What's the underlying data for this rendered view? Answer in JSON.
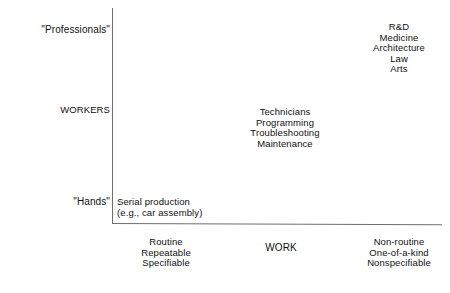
{
  "diagram": {
    "axes": {
      "vertical": {
        "name": "WORKERS",
        "title": "WORKERS",
        "top_label": "\"Professionals\"",
        "bottom_label": "\"Hands\""
      },
      "horizontal": {
        "name": "WORK",
        "title": "WORK",
        "left_label_lines": [
          "Routine",
          "Repeatable",
          "Specifiable"
        ],
        "right_label_lines": [
          "Non-routine",
          "One-of-a-kind",
          "Nonspecifiable"
        ]
      }
    },
    "clusters": [
      {
        "id": "serial-production",
        "quadrant": "low-workers-routine-work",
        "align": "left",
        "lines": [
          "Serial production",
          "(e.g., car assembly)"
        ]
      },
      {
        "id": "technical-occupations",
        "quadrant": "mid-workers-mid-work",
        "align": "center",
        "lines": [
          "Technicians",
          "Programming",
          "Troubleshooting",
          "Maintenance"
        ]
      },
      {
        "id": "professional-occupations",
        "quadrant": "high-workers-nonroutine-work",
        "align": "center",
        "lines": [
          "R&D",
          "Medicine",
          "Architecture",
          "Law",
          "Arts"
        ]
      }
    ],
    "colors": {
      "background": "#ffffff",
      "text": "#111111",
      "axis_line": "#6e6e6e"
    }
  },
  "chart_data": {
    "type": "scatter",
    "xlabel": "WORK",
    "ylabel": "WORKERS",
    "grid": false,
    "legend": "none",
    "x_axis": {
      "label": "WORK",
      "left_end": [
        "Routine",
        "Repeatable",
        "Specifiable"
      ],
      "right_end": [
        "Non-routine",
        "One-of-a-kind",
        "Nonspecifiable"
      ]
    },
    "y_axis": {
      "label": "WORKERS",
      "low_end": "\"Hands\"",
      "high_end": "\"Professionals\""
    },
    "points": [
      {
        "label": "Serial production (e.g., car assembly)",
        "x": "routine",
        "y": "hands"
      },
      {
        "label": "Technicians / Programming / Troubleshooting / Maintenance",
        "x": "intermediate",
        "y": "workers"
      },
      {
        "label": "R&D / Medicine / Architecture / Law / Arts",
        "x": "non-routine",
        "y": "professionals"
      }
    ]
  }
}
